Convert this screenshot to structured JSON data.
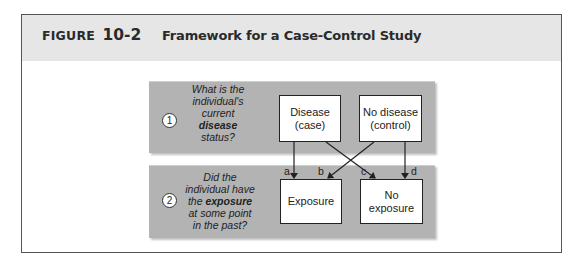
{
  "figure": {
    "label_word": "FIGURE",
    "label_number": "10-2",
    "title": "Framework for a Case-Control Study"
  },
  "steps": [
    {
      "number": "1",
      "question_lines": [
        "What is the",
        "individual's",
        "current"
      ],
      "question_bold": "disease",
      "question_tail": "status?",
      "boxes": [
        {
          "line1": "Disease",
          "line2": "(case)"
        },
        {
          "line1": "No disease",
          "line2": "(control)"
        }
      ]
    },
    {
      "number": "2",
      "question_line1": "Did the",
      "question_line2": "individual have",
      "question_line3_pre": "the ",
      "question_bold": "exposure",
      "question_line4": "at some point",
      "question_line5": "in the past?",
      "boxes": [
        {
          "line1": "Exposure",
          "line2": ""
        },
        {
          "line1": "No",
          "line2": "exposure"
        }
      ]
    }
  ],
  "arrows": [
    {
      "label": "a",
      "from": "Disease (case)",
      "to": "Exposure"
    },
    {
      "label": "b",
      "from": "No disease (control)",
      "to": "Exposure"
    },
    {
      "label": "c",
      "from": "Disease (case)",
      "to": "No exposure"
    },
    {
      "label": "d",
      "from": "No disease (control)",
      "to": "No exposure"
    }
  ],
  "colors": {
    "panel": "#b3b3b3",
    "header": "#e6e6e6",
    "frame": "#555555"
  }
}
